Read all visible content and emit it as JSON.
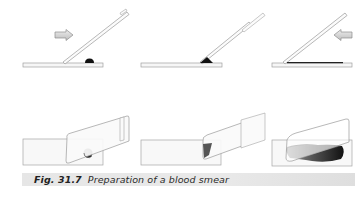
{
  "figure": {
    "caption": {
      "label": "Fig. 31.7",
      "text": "Preparation of a blood smear"
    },
    "panels_top": [
      {
        "step": 1,
        "view": "side",
        "drop": "round blood drop on slide",
        "arrow_direction": "right"
      },
      {
        "step": 2,
        "view": "side",
        "drop": "blood spreading along spreader edge",
        "arrow_direction": null
      },
      {
        "step": 3,
        "view": "side",
        "drop": "thin smear",
        "arrow_direction": "left"
      }
    ],
    "panels_bottom": [
      {
        "step": 1,
        "view": "perspective",
        "drop": "round blood drop"
      },
      {
        "step": 2,
        "view": "perspective",
        "drop": "blood along spreader edge"
      },
      {
        "step": 3,
        "view": "perspective",
        "drop": "blood smear spread"
      }
    ],
    "colors": {
      "slide_outline": "#9a9a9a",
      "slide_fill": "#f7f7f7",
      "blood": "#1a1a1a",
      "caption_bar": "#e6e6e6",
      "arrow_fill": "#d9d9d9"
    }
  }
}
